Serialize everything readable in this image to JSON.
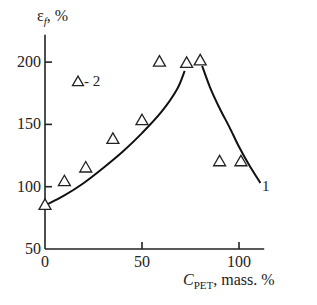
{
  "chart_data": {
    "type": "scatter",
    "title": "",
    "xlabel": "C_PET, mass. %",
    "xlabel_main": "C",
    "xlabel_sub": "PET",
    "xlabel_rest": ", mass. %",
    "ylabel": "εf, %",
    "ylabel_main": "ε",
    "ylabel_sub": "f",
    "ylabel_rest": ", %",
    "xlim": [
      0,
      115
    ],
    "ylim": [
      50,
      225
    ],
    "x_ticks": [
      0,
      50,
      100
    ],
    "y_ticks": [
      50,
      100,
      150,
      200
    ],
    "x_tick_labels": [
      "0",
      "50",
      "100"
    ],
    "y_tick_labels": [
      "50",
      "100",
      "150",
      "200"
    ],
    "grid": false,
    "legend": {
      "position": "upper-left",
      "entries": [
        "Δ - 2"
      ]
    },
    "series": [
      {
        "name": "2",
        "type": "scatter",
        "marker": "open-triangle",
        "x": [
          0,
          10,
          21,
          35,
          50,
          59,
          73,
          80,
          90,
          101
        ],
        "y": [
          85,
          104,
          115,
          138,
          153,
          200,
          199,
          201,
          120,
          120
        ]
      },
      {
        "name": "1",
        "type": "line",
        "segments": [
          {
            "x": [
              0,
              10,
              20,
              30,
              40,
              50,
              60,
              68,
              72
            ],
            "y": [
              85,
              93,
              103,
              115,
              128,
              143,
              160,
              178,
              193
            ]
          },
          {
            "x": [
              81,
              85,
              90,
              95,
              100,
              105,
              111
            ],
            "y": [
              197,
              180,
              163,
              148,
              132,
              118,
              103
            ]
          }
        ],
        "annotation": "1"
      }
    ]
  },
  "labels": {
    "legend_text": "- 2",
    "curve_label": "1"
  }
}
